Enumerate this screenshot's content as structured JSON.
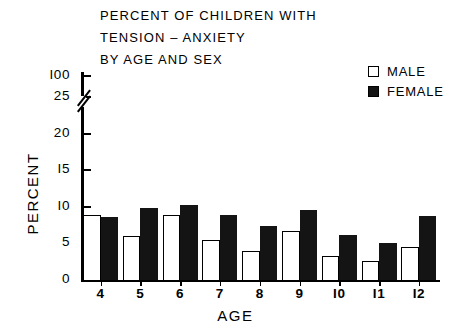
{
  "title": {
    "lines": [
      "PERCENT OF CHILDREN WITH",
      "TENSION – ANXIETY",
      "BY AGE AND SEX"
    ]
  },
  "legend": {
    "position": "top-right",
    "entries": [
      {
        "label": "MALE",
        "swatch": "open-square-icon",
        "color": "#ffffff"
      },
      {
        "label": "FEMALE",
        "swatch": "filled-square-icon",
        "color": "#141414"
      }
    ]
  },
  "axes": {
    "y_title": "PERCENT",
    "x_title": "AGE",
    "y_ticks": [
      "0",
      "5",
      "10",
      "15",
      "20",
      "25",
      "100"
    ],
    "y_break_between": [
      "25",
      "100"
    ],
    "x_ticks": [
      "4",
      "5",
      "6",
      "7",
      "8",
      "9",
      "10",
      "11",
      "12"
    ]
  },
  "chart_data": {
    "type": "bar",
    "title": "PERCENT OF CHILDREN WITH TENSION – ANXIETY BY AGE AND SEX",
    "xlabel": "AGE",
    "ylabel": "PERCENT",
    "categories": [
      "4",
      "5",
      "6",
      "7",
      "8",
      "9",
      "10",
      "11",
      "12"
    ],
    "series": [
      {
        "name": "MALE",
        "color": "#ffffff",
        "values": [
          8.9,
          6.0,
          8.9,
          5.4,
          3.9,
          6.7,
          3.3,
          2.6,
          4.5
        ]
      },
      {
        "name": "FEMALE",
        "color": "#141414",
        "values": [
          8.6,
          9.9,
          10.3,
          8.9,
          7.4,
          9.5,
          6.2,
          5.0,
          8.8
        ]
      }
    ],
    "ylim": [
      0,
      25
    ],
    "ytick_values": [
      0,
      5,
      10,
      15,
      20,
      25,
      100
    ],
    "axis_break": {
      "from": 25,
      "to": 100
    },
    "grid": false,
    "legend_position": "top-right"
  }
}
